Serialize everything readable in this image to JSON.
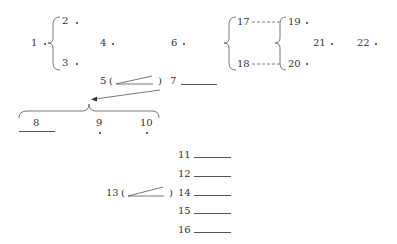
{
  "nodes": {
    "n1": "1",
    "n2": "2",
    "n3": "3",
    "n4": "4",
    "n5": "5",
    "n6": "6",
    "n7": "7",
    "n8": "8",
    "n9": "9",
    "n10": "10",
    "n11": "11",
    "n12": "12",
    "n13": "13",
    "n14": "14",
    "n15": "15",
    "n16": "16",
    "n17": "17",
    "n18": "18",
    "n19": "19",
    "n20": "20",
    "n21": "21",
    "n22": "22"
  },
  "symbols": {
    "paren_open": "(",
    "paren_close": ")"
  },
  "colors": {
    "ink": "#333333",
    "line": "#555555",
    "background": "#ffffff"
  }
}
